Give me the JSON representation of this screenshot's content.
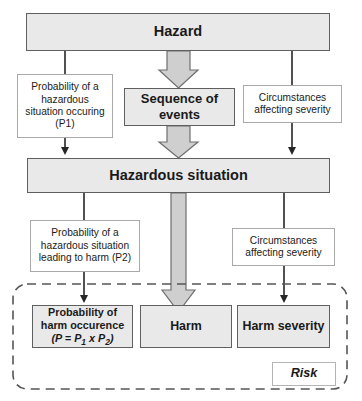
{
  "diagram": {
    "colors": {
      "box_fill": "#e9e9e9",
      "box_border": "#5f5f5f",
      "note_fill": "#ffffff",
      "note_border": "#a9a9a9",
      "arrow_fill": "#cfcfcf",
      "arrow_border": "#6e6e6e",
      "line": "#262626",
      "dashed_border": "#555555",
      "text": "#1a1a1a",
      "background": "#ffffff"
    },
    "nodes": {
      "hazard": "Hazard",
      "sequence_of_events": "Sequence of\nevents",
      "sequence_of_events_line1": "Sequence of",
      "sequence_of_events_line2": "events",
      "hazardous_situation": "Hazardous situation",
      "harm": "Harm",
      "harm_severity": "Harm severity",
      "probability_of_harm_line1": "Probability of",
      "probability_of_harm_line2": "harm occurence",
      "probability_of_harm_formula_open": "(",
      "probability_of_harm_formula_p": "P",
      "probability_of_harm_formula_eq": " = ",
      "probability_of_harm_formula_p1": "P",
      "probability_of_harm_formula_sub1": "1",
      "probability_of_harm_formula_times": " x ",
      "probability_of_harm_formula_p2": "P",
      "probability_of_harm_formula_sub2": "2",
      "probability_of_harm_formula_close": ")"
    },
    "notes": {
      "p1_line1": "Probability of a",
      "p1_line2": "hazardous",
      "p1_line3": "situation occuring",
      "p1_line4": "(P1)",
      "severity_top_line1": "Circumstances",
      "severity_top_line2": "affecting severity",
      "p2_line1": "Probability of a",
      "p2_line2": "hazardous situation",
      "p2_line3": "leading to harm (P2)",
      "severity_bottom_line1": "Circumstances",
      "severity_bottom_line2": "affecting severity"
    },
    "group": {
      "risk_label": "Risk"
    }
  }
}
